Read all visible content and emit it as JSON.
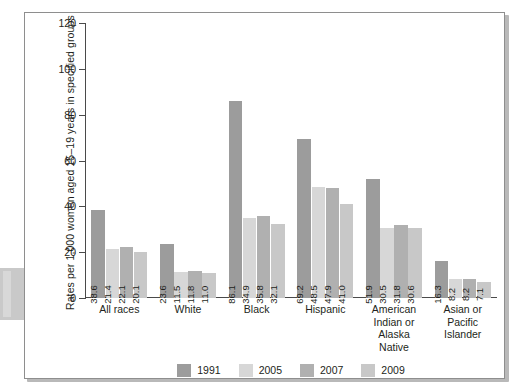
{
  "figure": {
    "frame_border_color": "#8e8e8e",
    "background": "#ffffff"
  },
  "chart_data": {
    "type": "bar",
    "title": "",
    "xlabel": "",
    "ylabel": "Rates per 1,000 women aged 15–19 years in specified groups",
    "ylim": [
      0,
      120
    ],
    "yticks": [
      0,
      20,
      40,
      60,
      80,
      100,
      120
    ],
    "ytick_labels": [
      "0",
      "20",
      "40",
      "60",
      "80",
      "100",
      "120"
    ],
    "grid": false,
    "legend_position": "bottom-center",
    "categories": [
      "All races",
      "White",
      "Black",
      "Hispanic",
      "American Indian or Alaska Native",
      "Asian or Pacific Islander"
    ],
    "category_label_lines": [
      [
        "All races"
      ],
      [
        "White"
      ],
      [
        "Black"
      ],
      [
        "Hispanic"
      ],
      [
        "American",
        "Indian or",
        "Alaska",
        "Native"
      ],
      [
        "Asian or",
        "Pacific",
        "Islander"
      ]
    ],
    "series": [
      {
        "name": "1991",
        "color": "#9c9c9c",
        "values": [
          38.6,
          23.6,
          86.1,
          69.2,
          51.9,
          16.3
        ],
        "labels": [
          "38.6",
          "23.6",
          "86.1",
          "69.2",
          "51.9",
          "16.3"
        ]
      },
      {
        "name": "2005",
        "color": "#d7d7d7",
        "values": [
          21.4,
          11.5,
          34.9,
          48.5,
          30.5,
          8.2
        ],
        "labels": [
          "21.4",
          "11.5",
          "34.9",
          "48.5",
          "30.5",
          "8.2"
        ]
      },
      {
        "name": "2007",
        "color": "#b0b0b0",
        "values": [
          22.1,
          11.8,
          35.8,
          47.9,
          31.8,
          8.2
        ],
        "labels": [
          "22.1",
          "11.8",
          "35.8",
          "47.9",
          "31.8",
          "8.2"
        ]
      },
      {
        "name": "2009",
        "color": "#c8c8c8",
        "values": [
          20.1,
          11.0,
          32.1,
          41.0,
          30.6,
          7.1
        ],
        "labels": [
          "20.1",
          "11.0",
          "32.1",
          "41.0",
          "30.6",
          "7.1"
        ]
      }
    ]
  },
  "legend": {
    "items": [
      {
        "label": "1991",
        "color": "#9c9c9c"
      },
      {
        "label": "2005",
        "color": "#d7d7d7"
      },
      {
        "label": "2007",
        "color": "#b0b0b0"
      },
      {
        "label": "2009",
        "color": "#c8c8c8"
      }
    ]
  }
}
